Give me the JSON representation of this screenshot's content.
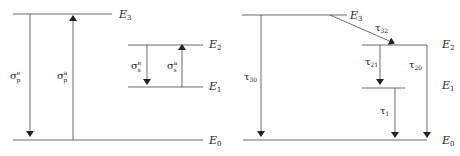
{
  "diagram": {
    "left": {
      "title": "Absorption / emission cross sections",
      "levels": [
        {
          "id": "E3",
          "base": "E",
          "sub": "3"
        },
        {
          "id": "E2",
          "base": "E",
          "sub": "2"
        },
        {
          "id": "E1",
          "base": "E",
          "sub": "1"
        },
        {
          "id": "E0",
          "base": "E",
          "sub": "0"
        }
      ],
      "transitions": [
        {
          "base": "σ",
          "sub": "p",
          "sup": "e",
          "from": "E3",
          "to": "E0",
          "direction": "down"
        },
        {
          "base": "σ",
          "sub": "p",
          "sup": "a",
          "from": "E0",
          "to": "E3",
          "direction": "up"
        },
        {
          "base": "σ",
          "sub": "s",
          "sup": "e",
          "from": "E2",
          "to": "E1",
          "direction": "down"
        },
        {
          "base": "σ",
          "sub": "s",
          "sup": "a",
          "from": "E1",
          "to": "E2",
          "direction": "up"
        }
      ]
    },
    "right": {
      "title": "Lifetimes",
      "levels": [
        {
          "id": "E3",
          "base": "E",
          "sub": "3"
        },
        {
          "id": "E2",
          "base": "E",
          "sub": "2"
        },
        {
          "id": "E1",
          "base": "E",
          "sub": "1"
        },
        {
          "id": "E0",
          "base": "E",
          "sub": "0"
        }
      ],
      "transitions": [
        {
          "base": "τ",
          "sub": "30",
          "from": "E3",
          "to": "E0"
        },
        {
          "base": "τ",
          "sub": "32",
          "from": "E3",
          "to": "E2"
        },
        {
          "base": "τ",
          "sub": "21",
          "from": "E2",
          "to": "E1"
        },
        {
          "base": "τ",
          "sub": "20",
          "from": "E2",
          "to": "E0"
        },
        {
          "base": "τ",
          "sub": "1",
          "from": "E1",
          "to": "E0"
        }
      ]
    },
    "colors": {
      "line": "#333333",
      "text": "#222222",
      "background": "#ffffff"
    }
  }
}
